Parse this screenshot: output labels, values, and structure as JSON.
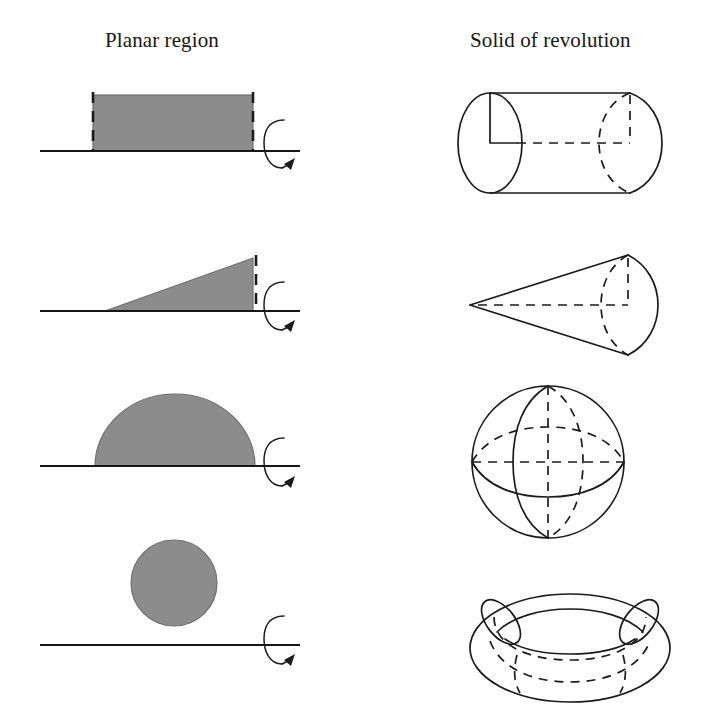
{
  "figure": {
    "title_planar": "Planar region",
    "title_solid": "Solid of revolution",
    "background_color": "#ffffff",
    "ink_color": "#1b1b1b",
    "region_fill_color": "#8c8c8c",
    "rows": [
      {
        "index": 1,
        "planar_shape": "rectangle",
        "planar_description": "Filled rectangle standing on the horizontal axis with dashed vertical sides",
        "solid_shape": "cylinder",
        "solid_description": "Cylinder lying horizontally, solid left ellipse, dashed back ellipse at right, dashed center axis",
        "rotation_symbol": "revolve-arrow"
      },
      {
        "index": 2,
        "planar_shape": "right-triangle",
        "planar_description": "Filled right triangle with horizontal base on the axis and dashed vertical right edge",
        "solid_shape": "cone",
        "solid_description": "Cone with apex at left, circular base at right shown with dashed back ellipse and dashed axis",
        "rotation_symbol": "revolve-arrow"
      },
      {
        "index": 3,
        "planar_shape": "semicircle",
        "planar_description": "Filled half disk resting with its diameter on the axis",
        "solid_shape": "sphere",
        "solid_description": "Sphere with solid meridian and equator arcs plus dashed hidden halves and dashed vertical axis",
        "rotation_symbol": "revolve-arrow"
      },
      {
        "index": 4,
        "planar_shape": "circle",
        "planar_description": "Filled disk floating above the axis, not touching it",
        "solid_shape": "torus",
        "solid_description": "Torus with outer outline, inner hole ellipse, side cross-section ellipses and dashed hidden curves",
        "rotation_symbol": "revolve-arrow"
      }
    ]
  }
}
